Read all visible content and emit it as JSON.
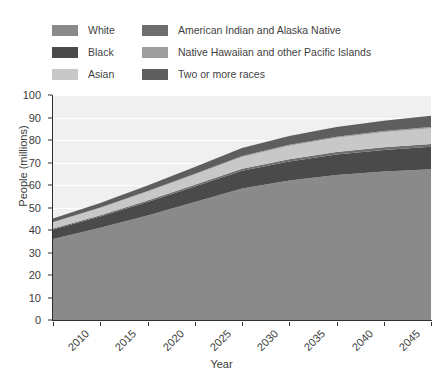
{
  "chart_data": {
    "type": "area",
    "stacked": true,
    "title": "",
    "xlabel": "Year",
    "ylabel": "People (millions)",
    "x": [
      2010,
      2015,
      2020,
      2025,
      2030,
      2035,
      2040,
      2045,
      2050
    ],
    "categories": [
      "2010",
      "2015",
      "2020",
      "2025",
      "2030",
      "2035",
      "2040",
      "2045",
      "2050"
    ],
    "xlim": [
      2010,
      2050
    ],
    "ylim": [
      0,
      100
    ],
    "yticks": [
      0,
      10,
      20,
      30,
      40,
      50,
      60,
      70,
      80,
      90,
      100
    ],
    "grid": "horizontal",
    "legend_position": "above-plot",
    "series": [
      {
        "name": "White",
        "color": "#8a8a8a",
        "values": [
          36.0,
          41.0,
          46.5,
          52.5,
          58.5,
          62.0,
          64.5,
          66.0,
          67.0
        ]
      },
      {
        "name": "Black",
        "color": "#4a4a4a",
        "values": [
          4.2,
          5.0,
          5.9,
          6.8,
          7.8,
          8.5,
          9.1,
          9.6,
          10.0
        ]
      },
      {
        "name": "American Indian and Alaska Native",
        "color": "#6e6e6e",
        "values": [
          0.5,
          0.6,
          0.7,
          0.8,
          0.9,
          1.0,
          1.1,
          1.15,
          1.2
        ]
      },
      {
        "name": "Asian",
        "color": "#c8c8c8",
        "values": [
          2.6,
          3.2,
          3.9,
          4.6,
          5.3,
          5.9,
          6.3,
          6.7,
          7.0
        ]
      },
      {
        "name": "Native Hawaiian and other Pacific Islands",
        "color": "#9e9e9e",
        "values": [
          0.2,
          0.25,
          0.3,
          0.35,
          0.4,
          0.45,
          0.5,
          0.55,
          0.6
        ]
      },
      {
        "name": "Two or more races",
        "color": "#5e5e5e",
        "values": [
          1.6,
          2.0,
          2.5,
          3.0,
          3.5,
          3.9,
          4.3,
          4.6,
          5.0
        ]
      }
    ],
    "totals": [
      45.1,
      52.05,
      59.8,
      68.05,
      76.4,
      81.75,
      85.8,
      88.6,
      90.8
    ]
  },
  "legend": {
    "columns": [
      {
        "items": [
          {
            "label": "White",
            "color": "#8a8a8a"
          },
          {
            "label": "Black",
            "color": "#4a4a4a"
          },
          {
            "label": "Asian",
            "color": "#c8c8c8"
          }
        ]
      },
      {
        "items": [
          {
            "label": "American Indian and Alaska Native",
            "color": "#6e6e6e"
          },
          {
            "label": "Native Hawaiian and other Pacific Islands",
            "color": "#9e9e9e"
          },
          {
            "label": "Two or more races",
            "color": "#5e5e5e"
          }
        ]
      }
    ]
  },
  "colors": {
    "plot_background": "#f0f0f0",
    "gridline": "#ffffff",
    "axis": "#2e2e2e",
    "text": "#3c3c3c",
    "page_background": "#ffffff"
  }
}
